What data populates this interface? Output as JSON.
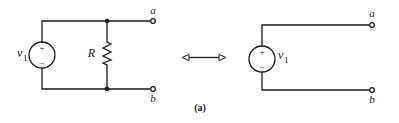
{
  "figure": {
    "caption": "(a)",
    "left_circuit": {
      "source_label": "v",
      "source_subscript": "1",
      "source_plus": "+",
      "source_minus": "–",
      "resistor_label": "R",
      "terminal_top": "a",
      "terminal_bottom": "b"
    },
    "equivalence_arrow": "double-headed-arrow",
    "right_circuit": {
      "source_label": "v",
      "source_subscript": "1",
      "source_plus": "+",
      "source_minus": "–",
      "terminal_top": "a",
      "terminal_bottom": "b"
    }
  }
}
